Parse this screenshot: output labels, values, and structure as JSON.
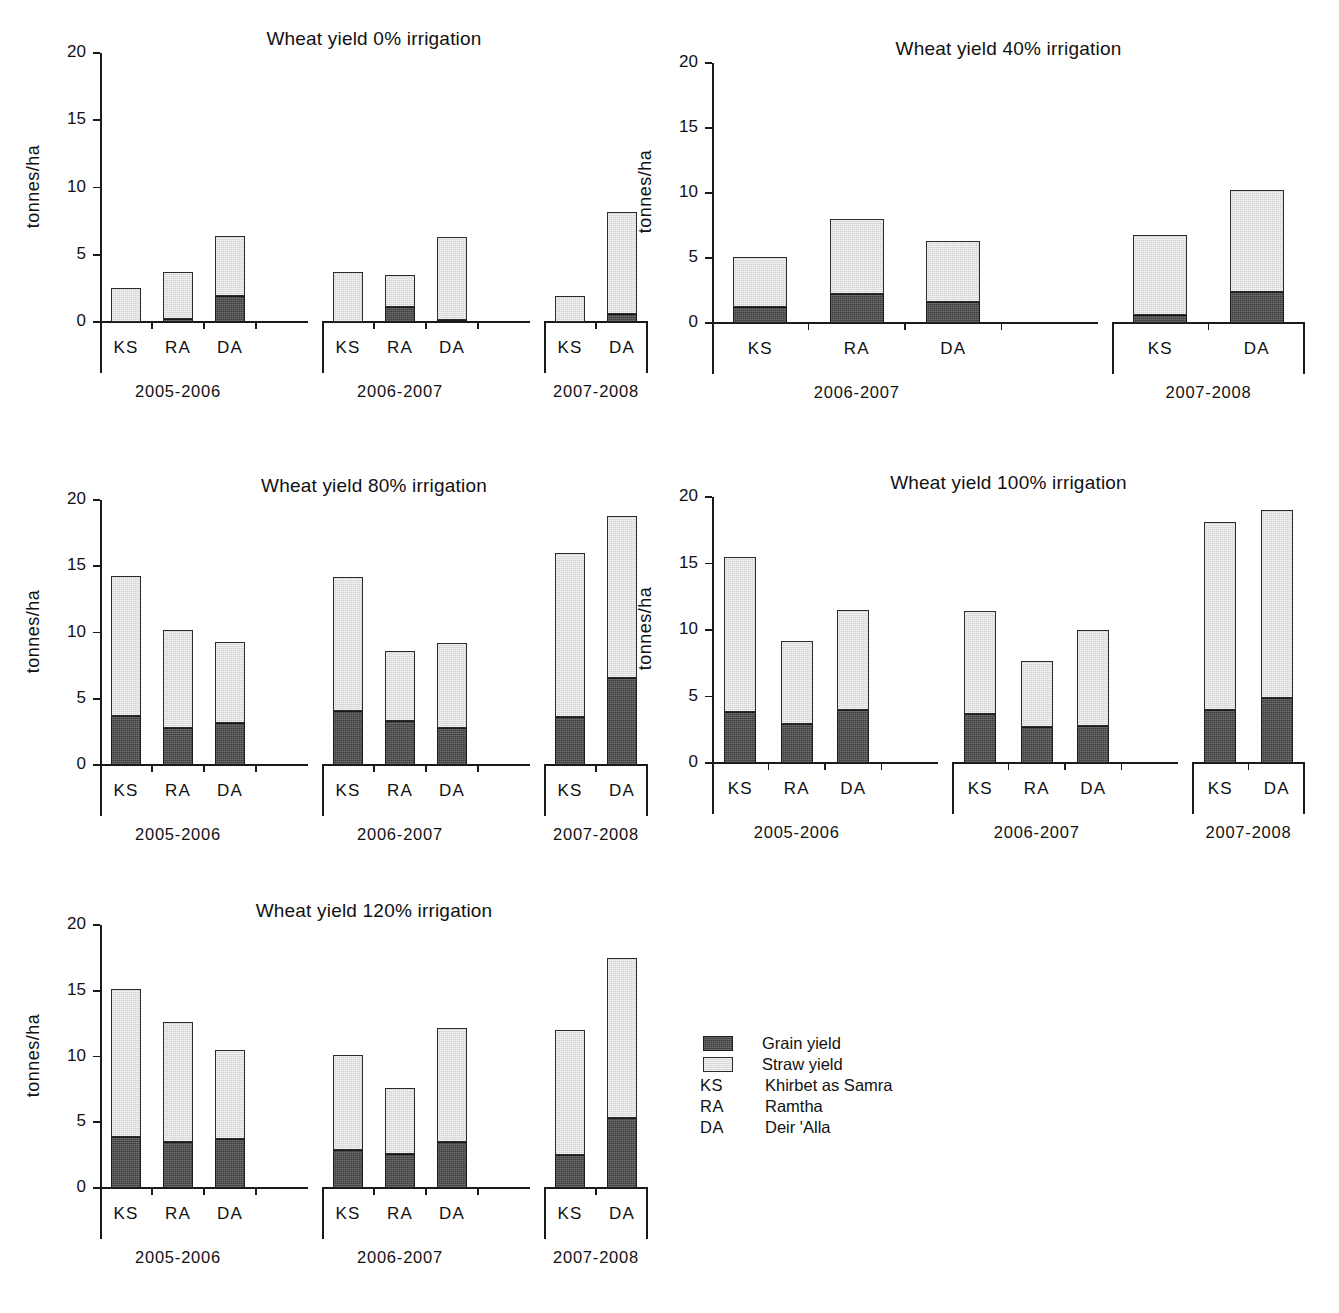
{
  "figure": {
    "ylabel": "tonnes/ha",
    "y_ticks": [
      "0",
      "5",
      "10",
      "15",
      "20"
    ],
    "seasons": [
      "2005-2006",
      "2006-2007",
      "2007-2008"
    ],
    "sites": [
      "KS",
      "RA",
      "DA"
    ]
  },
  "legend": {
    "items": [
      {
        "kind": "swatch",
        "swatch": "grain",
        "label": "Grain yield"
      },
      {
        "kind": "swatch",
        "swatch": "straw",
        "label": "Straw yield"
      },
      {
        "kind": "code",
        "code": "KS",
        "label": "Khirbet as Samra"
      },
      {
        "kind": "code",
        "code": "RA",
        "label": "Ramtha"
      },
      {
        "kind": "code",
        "code": "DA",
        "label": "Deir 'Alla"
      }
    ],
    "colors": {
      "grain": "#3d3d3d",
      "straw": "#d2d2d2",
      "axis": "#1a1a1a"
    }
  },
  "chart_data": [
    {
      "id": "irrigation-0",
      "type": "bar",
      "stacked": true,
      "title": "Wheat yield 0% irrigation",
      "xlabel": "",
      "ylabel": "tonnes/ha",
      "ylim": [
        0,
        20
      ],
      "yticks": [
        0,
        5,
        10,
        15,
        20
      ],
      "grid": false,
      "legend_position": "external",
      "series": [
        {
          "name": "Grain yield",
          "color": "#3d3d3d"
        },
        {
          "name": "Straw yield",
          "color": "#d2d2d2"
        }
      ],
      "groups": [
        {
          "season": "2005-2006",
          "slots": 4,
          "bars": [
            {
              "site": "KS",
              "grain": 0.0,
              "straw": 2.5,
              "total": 2.5
            },
            {
              "site": "RA",
              "grain": 0.2,
              "straw": 3.5,
              "total": 3.7
            },
            {
              "site": "DA",
              "grain": 1.9,
              "straw": 4.5,
              "total": 6.4
            }
          ]
        },
        {
          "season": "2006-2007",
          "slots": 4,
          "bars": [
            {
              "site": "KS",
              "grain": 0.0,
              "straw": 3.7,
              "total": 3.7
            },
            {
              "site": "RA",
              "grain": 1.1,
              "straw": 2.4,
              "total": 3.5
            },
            {
              "site": "DA",
              "grain": 0.15,
              "straw": 6.15,
              "total": 6.3
            }
          ]
        },
        {
          "season": "2007-2008",
          "slots": 2,
          "bars": [
            {
              "site": "KS",
              "grain": 0.0,
              "straw": 1.9,
              "total": 1.9
            },
            {
              "site": "DA",
              "grain": 0.6,
              "straw": 7.6,
              "total": 8.2
            }
          ]
        }
      ]
    },
    {
      "id": "irrigation-40",
      "type": "bar",
      "stacked": true,
      "title": "Wheat yield 40% irrigation",
      "xlabel": "",
      "ylabel": "tonnes/ha",
      "ylim": [
        0,
        20
      ],
      "yticks": [
        0,
        5,
        10,
        15,
        20
      ],
      "grid": false,
      "legend_position": "external",
      "series": [
        {
          "name": "Grain yield",
          "color": "#3d3d3d"
        },
        {
          "name": "Straw yield",
          "color": "#d2d2d2"
        }
      ],
      "groups": [
        {
          "season": "2006-2007",
          "slots": 4,
          "bars": [
            {
              "site": "KS",
              "grain": 1.2,
              "straw": 3.9,
              "total": 5.1
            },
            {
              "site": "RA",
              "grain": 2.2,
              "straw": 5.8,
              "total": 8.0
            },
            {
              "site": "DA",
              "grain": 1.6,
              "straw": 4.7,
              "total": 6.3
            }
          ]
        },
        {
          "season": "2007-2008",
          "slots": 2,
          "bars": [
            {
              "site": "KS",
              "grain": 0.6,
              "straw": 6.2,
              "total": 6.8
            },
            {
              "site": "DA",
              "grain": 2.4,
              "straw": 7.8,
              "total": 10.2
            }
          ]
        }
      ]
    },
    {
      "id": "irrigation-80",
      "type": "bar",
      "stacked": true,
      "title": "Wheat yield 80% irrigation",
      "xlabel": "",
      "ylabel": "tonnes/ha",
      "ylim": [
        0,
        20
      ],
      "yticks": [
        0,
        5,
        10,
        15,
        20
      ],
      "grid": false,
      "legend_position": "external",
      "series": [
        {
          "name": "Grain yield",
          "color": "#3d3d3d"
        },
        {
          "name": "Straw yield",
          "color": "#d2d2d2"
        }
      ],
      "groups": [
        {
          "season": "2005-2006",
          "slots": 4,
          "bars": [
            {
              "site": "KS",
              "grain": 3.7,
              "straw": 10.6,
              "total": 14.3
            },
            {
              "site": "RA",
              "grain": 2.8,
              "straw": 7.4,
              "total": 10.2
            },
            {
              "site": "DA",
              "grain": 3.2,
              "straw": 6.1,
              "total": 9.3
            }
          ]
        },
        {
          "season": "2006-2007",
          "slots": 4,
          "bars": [
            {
              "site": "KS",
              "grain": 4.1,
              "straw": 10.1,
              "total": 14.2
            },
            {
              "site": "RA",
              "grain": 3.3,
              "straw": 5.3,
              "total": 8.6
            },
            {
              "site": "DA",
              "grain": 2.8,
              "straw": 6.4,
              "total": 9.2
            }
          ]
        },
        {
          "season": "2007-2008",
          "slots": 2,
          "bars": [
            {
              "site": "KS",
              "grain": 3.6,
              "straw": 12.4,
              "total": 16.0
            },
            {
              "site": "DA",
              "grain": 6.6,
              "straw": 12.2,
              "total": 18.8
            }
          ]
        }
      ]
    },
    {
      "id": "irrigation-100",
      "type": "bar",
      "stacked": true,
      "title": "Wheat yield 100% irrigation",
      "xlabel": "",
      "ylabel": "tonnes/ha",
      "ylim": [
        0,
        20
      ],
      "yticks": [
        0,
        5,
        10,
        15,
        20
      ],
      "grid": false,
      "legend_position": "external",
      "series": [
        {
          "name": "Grain yield",
          "color": "#3d3d3d"
        },
        {
          "name": "Straw yield",
          "color": "#d2d2d2"
        }
      ],
      "groups": [
        {
          "season": "2005-2006",
          "slots": 4,
          "bars": [
            {
              "site": "KS",
              "grain": 3.8,
              "straw": 11.7,
              "total": 15.5
            },
            {
              "site": "RA",
              "grain": 2.9,
              "straw": 6.3,
              "total": 9.2
            },
            {
              "site": "DA",
              "grain": 4.0,
              "straw": 7.5,
              "total": 11.5
            }
          ]
        },
        {
          "season": "2006-2007",
          "slots": 4,
          "bars": [
            {
              "site": "KS",
              "grain": 3.7,
              "straw": 7.7,
              "total": 11.4
            },
            {
              "site": "RA",
              "grain": 2.7,
              "straw": 5.0,
              "total": 7.7
            },
            {
              "site": "DA",
              "grain": 2.8,
              "straw": 7.2,
              "total": 10.0
            }
          ]
        },
        {
          "season": "2007-2008",
          "slots": 2,
          "bars": [
            {
              "site": "KS",
              "grain": 4.0,
              "straw": 14.1,
              "total": 18.1
            },
            {
              "site": "DA",
              "grain": 4.9,
              "straw": 14.1,
              "total": 19.0
            }
          ]
        }
      ]
    },
    {
      "id": "irrigation-120",
      "type": "bar",
      "stacked": true,
      "title": "Wheat yield 120% irrigation",
      "xlabel": "",
      "ylabel": "tonnes/ha",
      "ylim": [
        0,
        20
      ],
      "yticks": [
        0,
        5,
        10,
        15,
        20
      ],
      "grid": false,
      "legend_position": "external",
      "series": [
        {
          "name": "Grain yield",
          "color": "#3d3d3d"
        },
        {
          "name": "Straw yield",
          "color": "#d2d2d2"
        }
      ],
      "groups": [
        {
          "season": "2005-2006",
          "slots": 4,
          "bars": [
            {
              "site": "KS",
              "grain": 3.9,
              "straw": 11.2,
              "total": 15.1
            },
            {
              "site": "RA",
              "grain": 3.5,
              "straw": 9.1,
              "total": 12.6
            },
            {
              "site": "DA",
              "grain": 3.7,
              "straw": 6.8,
              "total": 10.5
            }
          ]
        },
        {
          "season": "2006-2007",
          "slots": 4,
          "bars": [
            {
              "site": "KS",
              "grain": 2.9,
              "straw": 7.2,
              "total": 10.1
            },
            {
              "site": "RA",
              "grain": 2.6,
              "straw": 5.0,
              "total": 7.6
            },
            {
              "site": "DA",
              "grain": 3.5,
              "straw": 8.7,
              "total": 12.2
            }
          ]
        },
        {
          "season": "2007-2008",
          "slots": 2,
          "bars": [
            {
              "site": "KS",
              "grain": 2.5,
              "straw": 9.5,
              "total": 12.0
            },
            {
              "site": "DA",
              "grain": 5.3,
              "straw": 12.2,
              "total": 17.5
            }
          ]
        }
      ]
    }
  ]
}
